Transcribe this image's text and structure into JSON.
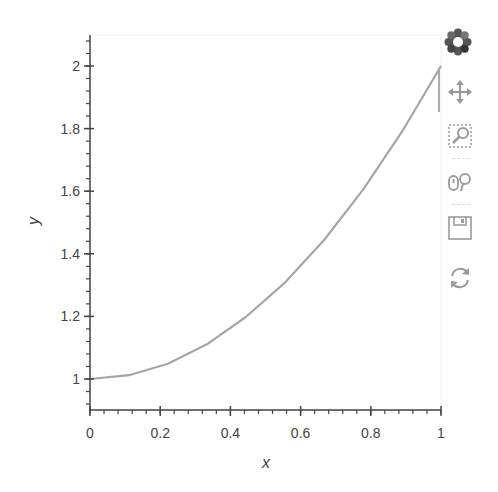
{
  "chart_data": {
    "type": "line",
    "title": "",
    "xlabel": "x",
    "ylabel": "y",
    "xlim": [
      0,
      1
    ],
    "ylim": [
      0.9,
      2.1
    ],
    "grid": false,
    "legend": null,
    "x_ticks": [
      0,
      0.2,
      0.4,
      0.6,
      0.8,
      1
    ],
    "x_tick_labels": [
      "0",
      "0.2",
      "0.4",
      "0.6",
      "0.8",
      "1"
    ],
    "y_ticks": [
      1,
      1.2,
      1.4,
      1.6,
      1.8,
      2
    ],
    "y_tick_labels": [
      "1",
      "1.2",
      "1.4",
      "1.6",
      "1.8",
      "2"
    ],
    "series": [
      {
        "name": "y = 1 + x^2",
        "color": "#a6a6a6",
        "x": [
          0,
          0.111,
          0.222,
          0.333,
          0.444,
          0.556,
          0.667,
          0.778,
          0.889,
          1.0
        ],
        "y": [
          1.0,
          1.012,
          1.049,
          1.111,
          1.198,
          1.309,
          1.444,
          1.605,
          1.79,
          2.0
        ]
      }
    ]
  },
  "toolbar": {
    "logo": "bokeh-logo-icon",
    "tools": [
      {
        "name": "pan",
        "icon": "pan-icon",
        "active": true
      },
      {
        "name": "box_zoom",
        "icon": "box-zoom-icon",
        "active": false
      },
      {
        "name": "wheel_zoom",
        "icon": "wheel-zoom-icon",
        "active": false
      },
      {
        "name": "save",
        "icon": "save-icon",
        "active": false
      },
      {
        "name": "reset",
        "icon": "reset-icon",
        "active": false
      }
    ]
  },
  "colors": {
    "axis": "#444444",
    "line": "#a6a6a6",
    "icon": "#9a9a9a"
  }
}
